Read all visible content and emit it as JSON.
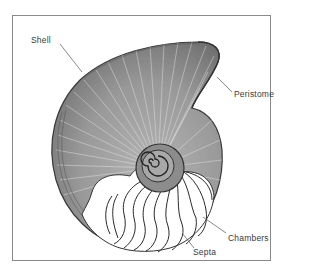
{
  "figure": {
    "labels": {
      "shell": "Shell",
      "peristome": "Peristome",
      "chambers": "Chambers",
      "septa": "Septa"
    }
  },
  "colors": {
    "frame": "#8a8a8a",
    "shell_fill": "#9a9a9a",
    "shell_dark": "#4a4a4a",
    "ribs": "#e8e8e8",
    "septa_lines": "#2a2a2a",
    "label_text": "#3a3a3a"
  }
}
